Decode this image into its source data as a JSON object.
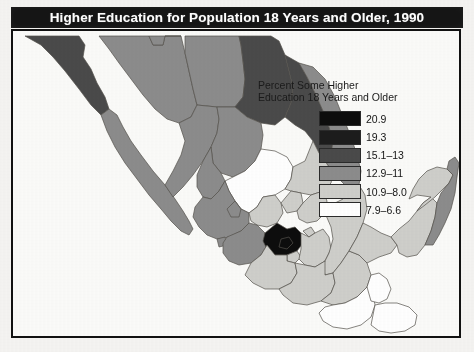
{
  "title": "Higher Education for Population 18 Years and Older, 1990",
  "legend": {
    "title_line1": "Percent Some Higher",
    "title_line2": "Education 18 Years and Older",
    "items": [
      {
        "label": "20.9",
        "color": "#0d0d0d"
      },
      {
        "label": "19.3",
        "color": "#1c1c1c"
      },
      {
        "label": "15.1–13",
        "color": "#4a4a4a"
      },
      {
        "label": "12.9–11",
        "color": "#8c8c8c"
      },
      {
        "label": "10.9–8.0",
        "color": "#cfcfcb"
      },
      {
        "label": "7.9–6.6",
        "color": "#ffffff"
      }
    ]
  },
  "map": {
    "country": "Mexico",
    "background_color": "#fbfbf9",
    "border_color": "#111111",
    "state_outline_color": "#55514c",
    "regions": [
      {
        "name": "baja-california-norte",
        "class_index": 2,
        "color": "#4a4a4a"
      },
      {
        "name": "baja-california-sur",
        "class_index": 3,
        "color": "#8c8c8c"
      },
      {
        "name": "sonora",
        "class_index": 3,
        "color": "#8c8c8c"
      },
      {
        "name": "chihuahua",
        "class_index": 3,
        "color": "#8c8c8c"
      },
      {
        "name": "coahuila",
        "class_index": 2,
        "color": "#4a4a4a"
      },
      {
        "name": "nuevo-leon",
        "class_index": 2,
        "color": "#4a4a4a"
      },
      {
        "name": "tamaulipas",
        "class_index": 3,
        "color": "#8c8c8c"
      },
      {
        "name": "sinaloa",
        "class_index": 3,
        "color": "#8c8c8c"
      },
      {
        "name": "durango",
        "class_index": 3,
        "color": "#8c8c8c"
      },
      {
        "name": "zacatecas",
        "class_index": 5,
        "color": "#ffffff"
      },
      {
        "name": "san-luis-potosi",
        "class_index": 4,
        "color": "#cfcfcb"
      },
      {
        "name": "nayarit",
        "class_index": 3,
        "color": "#8c8c8c"
      },
      {
        "name": "jalisco",
        "class_index": 3,
        "color": "#8c8c8c"
      },
      {
        "name": "aguascalientes",
        "class_index": 3,
        "color": "#8c8c8c"
      },
      {
        "name": "guanajuato",
        "class_index": 4,
        "color": "#cfcfcb"
      },
      {
        "name": "queretaro",
        "class_index": 4,
        "color": "#cfcfcb"
      },
      {
        "name": "hidalgo",
        "class_index": 4,
        "color": "#cfcfcb"
      },
      {
        "name": "colima",
        "class_index": 3,
        "color": "#8c8c8c"
      },
      {
        "name": "michoacan",
        "class_index": 3,
        "color": "#8c8c8c"
      },
      {
        "name": "mexico-state",
        "class_index": 0,
        "color": "#0d0d0d"
      },
      {
        "name": "distrito-federal",
        "class_index": 0,
        "color": "#0d0d0d"
      },
      {
        "name": "morelos",
        "class_index": 4,
        "color": "#cfcfcb"
      },
      {
        "name": "tlaxcala",
        "class_index": 4,
        "color": "#cfcfcb"
      },
      {
        "name": "puebla",
        "class_index": 4,
        "color": "#cfcfcb"
      },
      {
        "name": "veracruz",
        "class_index": 4,
        "color": "#cfcfcb"
      },
      {
        "name": "guerrero",
        "class_index": 4,
        "color": "#cfcfcb"
      },
      {
        "name": "oaxaca",
        "class_index": 4,
        "color": "#cfcfcb"
      },
      {
        "name": "chiapas",
        "class_index": 4,
        "color": "#cfcfcb"
      },
      {
        "name": "tabasco",
        "class_index": 4,
        "color": "#cfcfcb"
      },
      {
        "name": "campeche",
        "class_index": 4,
        "color": "#cfcfcb"
      },
      {
        "name": "yucatan",
        "class_index": 4,
        "color": "#cfcfcb"
      },
      {
        "name": "quintana-roo",
        "class_index": 3,
        "color": "#8c8c8c"
      },
      {
        "name": "guatemala-outline",
        "class_index": 5,
        "color": "#ffffff"
      },
      {
        "name": "belize-outline",
        "class_index": 5,
        "color": "#ffffff"
      }
    ]
  }
}
